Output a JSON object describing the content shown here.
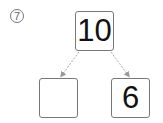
{
  "problem": {
    "number_label": "7"
  },
  "number_bond": {
    "whole": "10",
    "part_left": "",
    "part_right": "6"
  },
  "colors": {
    "box_border": "#777777",
    "arrow": "#aaaaaa",
    "text": "#111111"
  }
}
